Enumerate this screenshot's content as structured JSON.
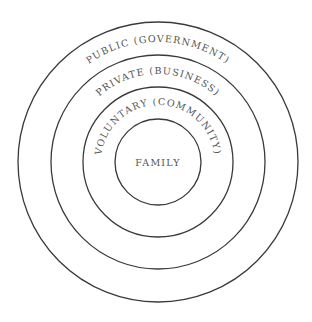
{
  "diagram": {
    "type": "concentric-circles",
    "rings": [
      {
        "label": "PUBLIC (GOVERNMENT)",
        "level": 1
      },
      {
        "label": "PRIVATE (BUSINESS)",
        "level": 2
      },
      {
        "label": "VOLUNTARY (COMMUNITY)",
        "level": 3
      },
      {
        "label": "FAMILY",
        "level": 4
      }
    ],
    "colors": {
      "stroke": "#3a3a3a",
      "text": "#555555",
      "background": "#ffffff"
    }
  }
}
